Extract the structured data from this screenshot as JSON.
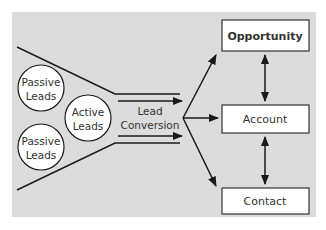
{
  "diagram": {
    "background_color": "#dcdcdc",
    "line_color": "#1a1a1a",
    "leads": [
      {
        "id": "passive-leads-top",
        "lines": [
          "Passive",
          "Leads"
        ]
      },
      {
        "id": "active-leads",
        "lines": [
          "Active",
          "Leads"
        ]
      },
      {
        "id": "passive-leads-bottom",
        "lines": [
          "Passive",
          "Leads"
        ]
      }
    ],
    "conversion": {
      "lines": [
        "Lead",
        "Conversion"
      ]
    },
    "entities": [
      {
        "id": "opportunity",
        "label": "Opportunity",
        "bold": true
      },
      {
        "id": "account",
        "label": "Account",
        "bold": false
      },
      {
        "id": "contact",
        "label": "Contact",
        "bold": false
      }
    ],
    "edges": [
      {
        "from": "lead-conversion",
        "to": "opportunity",
        "type": "arrow"
      },
      {
        "from": "lead-conversion",
        "to": "account",
        "type": "arrow"
      },
      {
        "from": "lead-conversion",
        "to": "contact",
        "type": "arrow"
      },
      {
        "from": "opportunity",
        "to": "account",
        "type": "bidirectional"
      },
      {
        "from": "account",
        "to": "contact",
        "type": "bidirectional"
      }
    ]
  }
}
